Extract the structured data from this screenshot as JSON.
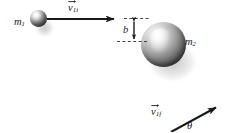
{
  "figure": {
    "type": "physics-collision-diagram",
    "background_color": "#ffffff",
    "ink_color": "#1a1a1a",
    "width": 227,
    "height": 132
  },
  "labels": {
    "mass_1": "m",
    "mass_1_sub": "1",
    "mass_2": "m",
    "mass_2_sub": "2",
    "impact_parameter": "b",
    "angle": "θ",
    "velocity_initial": "v",
    "velocity_initial_sub": "1i",
    "velocity_final": "v",
    "velocity_final_sub": "1f"
  },
  "elements": {
    "sphere_small_name": "mass-1-sphere",
    "sphere_large_name": "mass-2-sphere",
    "incoming_vector_name": "initial-velocity-vector",
    "outgoing_vector_name": "final-velocity-vector",
    "impact_parameter_name": "impact-parameter-dimension",
    "dashed_top_name": "upper-reference-dashed-line",
    "dashed_bottom_name": "lower-reference-dashed-line"
  },
  "geometry": {
    "sphere_small": {
      "cx": 38.5,
      "cy": 18.5,
      "r": 8.5
    },
    "sphere_large": {
      "cx": 163.5,
      "cy": 44.5,
      "r": 22.5
    },
    "incoming_arrow": {
      "x1": 47,
      "y1": 19,
      "x2": 123,
      "y2": 19
    },
    "outgoing_arrow": {
      "x1": 171,
      "y1": 132,
      "x2": 223,
      "y2": 104
    },
    "dashed_top": {
      "x1": 122,
      "y1": 18.5,
      "x2": 150,
      "y2": 18.5
    },
    "dashed_bottom": {
      "x1": 117,
      "y1": 41.5,
      "x2": 146,
      "y2": 41.5
    },
    "impact_arrow": {
      "x": 134,
      "y1": 19,
      "y2": 41
    }
  }
}
